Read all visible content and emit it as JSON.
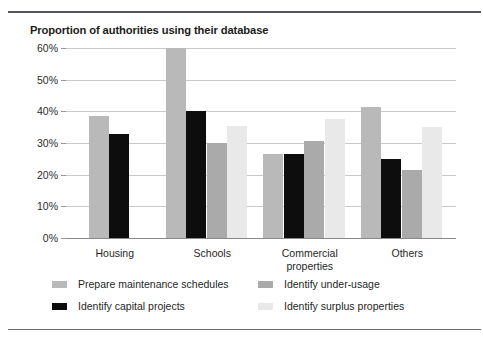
{
  "chart_data": {
    "type": "bar",
    "title": "Proportion of authorities using their database",
    "xlabel": "",
    "ylabel": "",
    "ylim": [
      0,
      60
    ],
    "ytick_labels": [
      "0%",
      "10%",
      "20%",
      "30%",
      "40%",
      "50%",
      "60%"
    ],
    "ytick_values": [
      0,
      10,
      20,
      30,
      40,
      50,
      60
    ],
    "grid": true,
    "legend_position": "bottom",
    "categories": [
      "Housing",
      "Schools",
      "Commercial properties",
      "Others"
    ],
    "series": [
      {
        "name": "Prepare maintenance schedules",
        "color": "#b9b9b9",
        "values": [
          38.5,
          60.0,
          26.5,
          41.5
        ]
      },
      {
        "name": "Identify capital projects",
        "color": "#0d0d0d",
        "values": [
          33.0,
          40.0,
          26.5,
          25.0
        ]
      },
      {
        "name": "Identify under-usage",
        "color": "#aaaaaa",
        "values": [
          null,
          30.0,
          30.5,
          21.5
        ]
      },
      {
        "name": "Identify surplus properties",
        "color": "#e9e9e9",
        "values": [
          null,
          35.5,
          37.5,
          35.0
        ]
      }
    ]
  }
}
